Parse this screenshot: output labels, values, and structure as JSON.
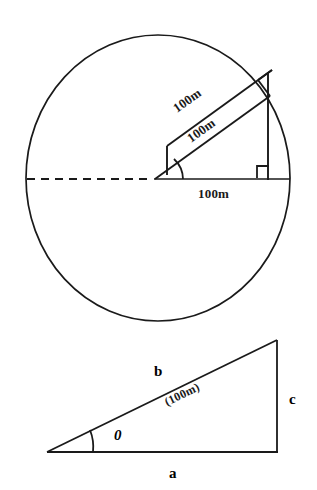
{
  "document": {
    "title": "Geometry figure: circle with inclined 100m segments and right triangle",
    "background_color": "#ffffff",
    "ink_color": "#1a1a1a"
  },
  "figures": [
    {
      "id": "circle-figure",
      "name": "circle-with-inclined-rods",
      "shapes": {
        "circle": {
          "cx": 158,
          "cy": 178,
          "rx": 132,
          "ry": 143
        },
        "dashed_radius": {
          "x1": 27,
          "y1": 179,
          "x2": 155,
          "y2": 179
        },
        "base_line": {
          "x1": 155,
          "y1": 179,
          "x2": 289,
          "y2": 179
        },
        "vertical_line": {
          "x1": 268,
          "y1": 72,
          "x2": 268,
          "y2": 179
        },
        "right_angle_marker": {
          "x": 258,
          "y": 166,
          "size": 12
        },
        "angle_arc_radius": 26
      },
      "labels": {
        "upper_rod": "100m",
        "lower_rod": "100m",
        "base": "100m"
      }
    },
    {
      "id": "triangle-figure",
      "name": "right-triangle",
      "shapes": {
        "vertex_left": {
          "x": 47,
          "y": 452
        },
        "vertex_right_bottom": {
          "x": 277,
          "y": 452
        },
        "vertex_right_top": {
          "x": 277,
          "y": 340
        },
        "angle_arc_radius": 44
      },
      "labels": {
        "hypotenuse": "b",
        "hypotenuse_value": "(100m)",
        "angle": "0",
        "vertical_side": "c",
        "base_side": "a"
      }
    }
  ]
}
